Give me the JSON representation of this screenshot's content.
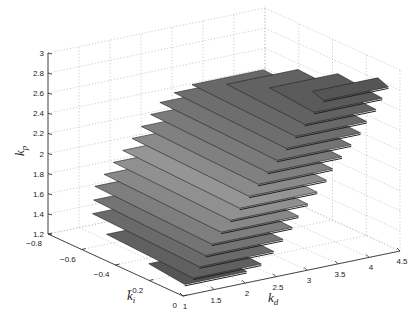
{
  "chart_data": {
    "type": "3d-surface-slices",
    "title": "",
    "axes": {
      "x": {
        "label": "k",
        "sub": "d",
        "range": [
          1,
          4.5
        ],
        "ticks": [
          1,
          1.5,
          2,
          2.5,
          3,
          3.5,
          4,
          4.5
        ]
      },
      "y": {
        "label": "k",
        "sub": "i",
        "range": [
          -0.8,
          0
        ],
        "ticks": [
          -0.8,
          -0.6,
          -0.4,
          -0.2,
          0
        ]
      },
      "z": {
        "label": "k",
        "sub": "p",
        "range": [
          1.2,
          3
        ],
        "ticks": [
          1.2,
          1.4,
          1.6,
          1.8,
          2,
          2.2,
          2.4,
          2.6,
          2.8,
          3
        ]
      }
    },
    "grid": true,
    "slices": [
      {
        "kp": 1.2,
        "kd": [
          1.3,
          2.3
        ],
        "ki": [
          -0.35,
          -0.1
        ],
        "shade": "#555555"
      },
      {
        "kp": 1.3,
        "kd": [
          1.3,
          2.4
        ],
        "ki": [
          -0.6,
          -0.05
        ],
        "shade": "#606060"
      },
      {
        "kp": 1.4,
        "kd": [
          1.4,
          2.6
        ],
        "ki": [
          -0.72,
          -0.05
        ],
        "shade": "#6a6a6a"
      },
      {
        "kp": 1.5,
        "kd": [
          1.5,
          2.75
        ],
        "ki": [
          -0.75,
          -0.05
        ],
        "shade": "#747474"
      },
      {
        "kp": 1.6,
        "kd": [
          1.6,
          2.9
        ],
        "ki": [
          -0.78,
          -0.05
        ],
        "shade": "#7e7e7e"
      },
      {
        "kp": 1.7,
        "kd": [
          1.75,
          3.0
        ],
        "ki": [
          -0.78,
          -0.05
        ],
        "shade": "#888888"
      },
      {
        "kp": 1.8,
        "kd": [
          1.9,
          3.15
        ],
        "ki": [
          -0.78,
          -0.05
        ],
        "shade": "#909090"
      },
      {
        "kp": 1.9,
        "kd": [
          2.05,
          3.3
        ],
        "ki": [
          -0.78,
          -0.05
        ],
        "shade": "#959595"
      },
      {
        "kp": 2.0,
        "kd": [
          2.2,
          3.45
        ],
        "ki": [
          -0.78,
          -0.05
        ],
        "shade": "#8a8a8a"
      },
      {
        "kp": 2.1,
        "kd": [
          2.35,
          3.55
        ],
        "ki": [
          -0.78,
          -0.05
        ],
        "shade": "#808080"
      },
      {
        "kp": 2.2,
        "kd": [
          2.5,
          3.7
        ],
        "ki": [
          -0.78,
          -0.05
        ],
        "shade": "#7a7a7a"
      },
      {
        "kp": 2.3,
        "kd": [
          2.65,
          3.85
        ],
        "ki": [
          -0.78,
          -0.05
        ],
        "shade": "#747474"
      },
      {
        "kp": 2.4,
        "kd": [
          2.8,
          4.0
        ],
        "ki": [
          -0.75,
          -0.05
        ],
        "shade": "#6e6e6e"
      },
      {
        "kp": 2.5,
        "kd": [
          2.95,
          4.1
        ],
        "ki": [
          -0.7,
          -0.05
        ],
        "shade": "#686868"
      },
      {
        "kp": 2.6,
        "kd": [
          3.1,
          4.25
        ],
        "ki": [
          -0.55,
          -0.05
        ],
        "shade": "#626262"
      },
      {
        "kp": 2.7,
        "kd": [
          3.25,
          4.35
        ],
        "ki": [
          -0.35,
          -0.05
        ],
        "shade": "#5a5a5a"
      },
      {
        "kp": 2.8,
        "kd": [
          3.4,
          4.45
        ],
        "ki": [
          -0.15,
          -0.05
        ],
        "shade": "#555555"
      }
    ]
  }
}
